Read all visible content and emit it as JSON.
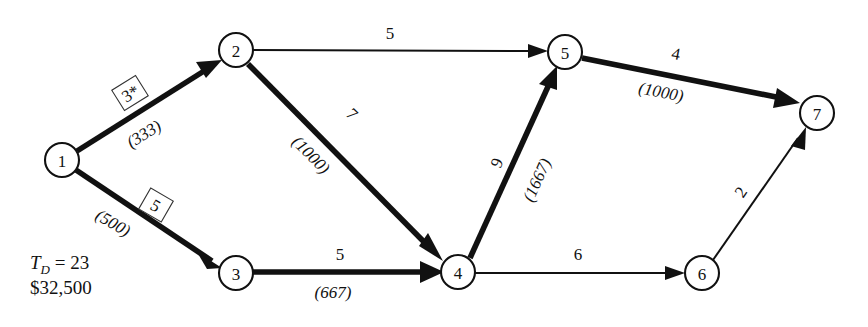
{
  "diagram": {
    "type": "activity-on-arrow network",
    "nodes": [
      {
        "id": "1",
        "label": "1",
        "cx": 62,
        "cy": 160
      },
      {
        "id": "2",
        "label": "2",
        "cx": 236,
        "cy": 50
      },
      {
        "id": "3",
        "label": "3",
        "cx": 236,
        "cy": 273
      },
      {
        "id": "4",
        "label": "4",
        "cx": 458,
        "cy": 272
      },
      {
        "id": "5",
        "label": "5",
        "cx": 565,
        "cy": 52
      },
      {
        "id": "6",
        "label": "6",
        "cx": 702,
        "cy": 273
      },
      {
        "id": "7",
        "label": "7",
        "cx": 817,
        "cy": 113
      }
    ],
    "node_radius": 17,
    "edges": [
      {
        "from": "1",
        "to": "2",
        "duration": "3*",
        "cost": "(333)",
        "critical": true,
        "boxed": true
      },
      {
        "from": "1",
        "to": "3",
        "duration": "5",
        "cost": "(500)",
        "critical": true,
        "boxed": true
      },
      {
        "from": "2",
        "to": "5",
        "duration": "5",
        "cost": "",
        "critical": false,
        "boxed": false
      },
      {
        "from": "2",
        "to": "4",
        "duration": "7",
        "cost": "(1000)",
        "critical": true,
        "boxed": false
      },
      {
        "from": "3",
        "to": "4",
        "duration": "5",
        "cost": "(667)",
        "critical": true,
        "boxed": false
      },
      {
        "from": "4",
        "to": "5",
        "duration": "9",
        "cost": "(1667)",
        "critical": true,
        "boxed": false
      },
      {
        "from": "4",
        "to": "6",
        "duration": "6",
        "cost": "",
        "critical": false,
        "boxed": false
      },
      {
        "from": "5",
        "to": "7",
        "duration": "4",
        "cost": "(1000)",
        "critical": true,
        "boxed": false
      },
      {
        "from": "6",
        "to": "7",
        "duration": "2",
        "cost": "",
        "critical": false,
        "boxed": false
      }
    ],
    "summary": {
      "duration_symbol": "T",
      "duration_subscript": "D",
      "duration_equals": "=",
      "duration_value": "23",
      "cost_value": "$32,500"
    },
    "colors": {
      "ink": "#111111",
      "paper": "#ffffff",
      "box_stroke": "#333333"
    }
  }
}
